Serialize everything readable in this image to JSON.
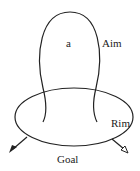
{
  "diagram": {
    "labels": {
      "inner": "a",
      "aim": "Aim",
      "rim": "Rim",
      "goal": "Goal"
    },
    "colors": {
      "stroke": "#222222",
      "background": "#ffffff"
    },
    "shapes": {
      "upper_loop": "open-ended balloon loop labeled Aim",
      "base_ellipse": "horizontal ellipse labeled Goal",
      "left_arrow": "filled arrowhead pointing down-left",
      "right_arrow": "open arrowhead pointing down-right"
    }
  }
}
